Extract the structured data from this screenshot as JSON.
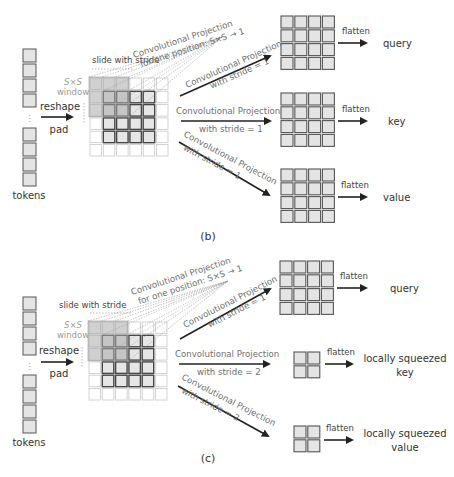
{
  "colors": {
    "cell_fill": "#e4e4e4",
    "cell_stroke": "#555555",
    "pad_stroke": "#c8c8c8",
    "window_fill": "#a9a9a9",
    "arrow": "#222222",
    "dashed": "#8a8a8a"
  },
  "panels": [
    {
      "id": "b",
      "caption": "(b)",
      "offset_y": 0,
      "tokens_label": "tokens",
      "reshape_label": "reshape",
      "pad_label": "pad",
      "slide_label": "slide with stride",
      "window_label_math": "S×S",
      "window_label": "window",
      "proj_one_pos_line1": "Convolutional Projection",
      "proj_one_pos_line2": "for one position: S×S → 1",
      "branches": [
        {
          "name": "query",
          "proj_line1": "Convolutional Projection",
          "proj_line2": "with stride = 1",
          "flatten_label": "flatten",
          "output_line1": "query",
          "output_line2": "",
          "grid_size": 4
        },
        {
          "name": "key",
          "proj_line1": "Convolutional Projection",
          "proj_line2": "with stride = 1",
          "flatten_label": "flatten",
          "output_line1": "key",
          "output_line2": "",
          "grid_size": 4
        },
        {
          "name": "value",
          "proj_line1": "Convolutional Projection",
          "proj_line2": "with stride = 1",
          "flatten_label": "flatten",
          "output_line1": "value",
          "output_line2": "",
          "grid_size": 4
        }
      ]
    },
    {
      "id": "c",
      "caption": "(c)",
      "offset_y": 230,
      "tokens_label": "tokens",
      "reshape_label": "reshape",
      "pad_label": "pad",
      "slide_label": "slide with stride",
      "window_label_math": "S×S",
      "window_label": "window",
      "proj_one_pos_line1": "Convolutional Projection",
      "proj_one_pos_line2": "for one position: S×S → 1",
      "branches": [
        {
          "name": "query",
          "proj_line1": "Convolutional Projection",
          "proj_line2": "with stride = 1",
          "flatten_label": "flatten",
          "output_line1": "query",
          "output_line2": "",
          "grid_size": 4
        },
        {
          "name": "key",
          "proj_line1": "Convolutional Projection",
          "proj_line2": "with stride = 2",
          "flatten_label": "flatten",
          "output_line1": "locally squeezed",
          "output_line2": "key",
          "grid_size": 2
        },
        {
          "name": "value",
          "proj_line1": "Convolutional Projection",
          "proj_line2": "with stride = 2",
          "flatten_label": "flatten",
          "output_line1": "locally squeezed",
          "output_line2": "value",
          "grid_size": 2
        }
      ]
    }
  ],
  "icons": {
    "vertical_dots": "⋮"
  }
}
